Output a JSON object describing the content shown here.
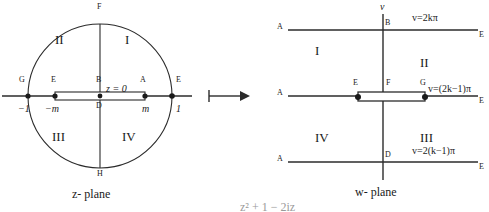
{
  "figure": {
    "arrow_glyph": "⟼",
    "line_color": "#2b2b2b",
    "text_color": "#1a1a1a"
  },
  "z_plane": {
    "name": "z- plane",
    "center_label": "z = 0",
    "quadrants": [
      {
        "id": "I",
        "label": "I"
      },
      {
        "id": "II",
        "label": "II"
      },
      {
        "id": "III",
        "label": "III"
      },
      {
        "id": "IV",
        "label": "IV"
      }
    ],
    "points": [
      {
        "name": "F",
        "label": "F"
      },
      {
        "name": "H",
        "label": "H"
      },
      {
        "name": "G",
        "label": "G"
      },
      {
        "name": "E-left",
        "label": "E"
      },
      {
        "name": "B",
        "label": "B"
      },
      {
        "name": "A",
        "label": "A"
      },
      {
        "name": "E-right",
        "label": "E"
      },
      {
        "name": "D",
        "label": "D"
      }
    ],
    "axis_ticks": [
      {
        "name": "minus-one",
        "label": "−1"
      },
      {
        "name": "minus-m",
        "label": "−m"
      },
      {
        "name": "plus-m",
        "label": "m"
      },
      {
        "name": "one",
        "label": "1"
      }
    ]
  },
  "w_plane": {
    "name": "w- plane",
    "vertical_axis_label": "v",
    "quadrants": [
      {
        "id": "I",
        "label": "I"
      },
      {
        "id": "II",
        "label": "II"
      },
      {
        "id": "III",
        "label": "III"
      },
      {
        "id": "IV",
        "label": "IV"
      }
    ],
    "boundary_equations": [
      {
        "name": "top-line",
        "label": "v=2kπ"
      },
      {
        "name": "middle-line",
        "label": "v=(2k−1)π"
      },
      {
        "name": "bottom-line",
        "label": "v=2(k−1)π"
      }
    ],
    "points": [
      {
        "name": "A-top",
        "label": "A"
      },
      {
        "name": "B",
        "label": "B"
      },
      {
        "name": "E-top-right",
        "label": "E"
      },
      {
        "name": "A-mid",
        "label": "A"
      },
      {
        "name": "E-mid",
        "label": "E"
      },
      {
        "name": "F",
        "label": "F"
      },
      {
        "name": "G",
        "label": "G"
      },
      {
        "name": "E-mid-right",
        "label": "E"
      },
      {
        "name": "A-bottom",
        "label": "A"
      },
      {
        "name": "D",
        "label": "D"
      },
      {
        "name": "E-bottom-right",
        "label": "E"
      }
    ]
  },
  "footer": {
    "partial_formula": "z² + 1 − 2iz"
  }
}
